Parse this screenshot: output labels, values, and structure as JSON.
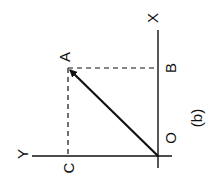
{
  "diagram": {
    "caption": "(b)",
    "orientation": "rotated -90deg",
    "colors": {
      "line": "#111111",
      "background": "#ffffff"
    },
    "labels": {
      "x_axis": "X",
      "y_axis": "Y",
      "origin": "O",
      "point_a": "A",
      "point_b": "B",
      "point_c": "C"
    },
    "elements": [
      {
        "type": "axis",
        "name": "X",
        "from": "O",
        "direction": "up"
      },
      {
        "type": "axis",
        "name": "Y",
        "from": "O",
        "direction": "left"
      },
      {
        "type": "vector",
        "from": "O",
        "to": "A",
        "arrowhead": true
      },
      {
        "type": "dashed-line",
        "from": "A",
        "to": "B",
        "meaning": "projection of A onto X axis"
      },
      {
        "type": "dashed-line",
        "from": "A",
        "to": "C",
        "meaning": "projection of A onto Y axis"
      }
    ]
  }
}
